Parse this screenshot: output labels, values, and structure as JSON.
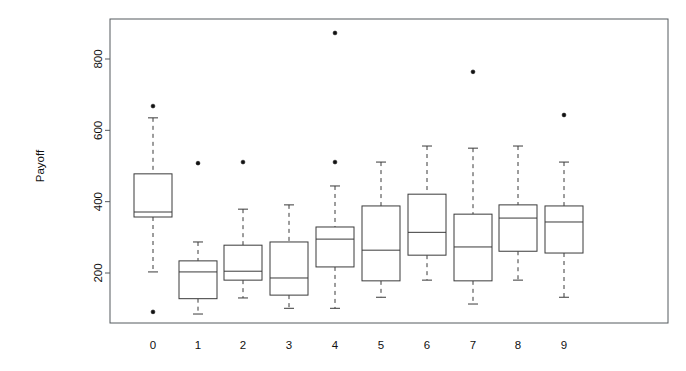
{
  "chart_data": {
    "type": "boxplot",
    "title": "",
    "subtitle": "",
    "xlabel": "",
    "ylabel": "Payoff",
    "categories": [
      "0",
      "1",
      "2",
      "3",
      "4",
      "5",
      "6",
      "7",
      "8",
      "9"
    ],
    "x_tick_labels": [
      "0",
      "1",
      "2",
      "3",
      "4",
      "5",
      "6",
      "7",
      "8",
      "9"
    ],
    "y_tick_labels": [
      "200",
      "400",
      "600",
      "800"
    ],
    "y_ticks": [
      200,
      400,
      600,
      800
    ],
    "ylim": [
      60,
      900
    ],
    "grid": false,
    "legend": null,
    "legend_position": "none",
    "frame": true,
    "colors": {
      "box_stroke": "#3a3a3a",
      "box_fill": "#ffffff",
      "whisker": "#3a3a3a",
      "outlier": "#111111",
      "frame": "#555a5e",
      "text": "#111111"
    },
    "boxes": [
      {
        "category": "0",
        "lower_whisker": 203,
        "q1": 357,
        "median": 371,
        "q3": 478,
        "upper_whisker": 635,
        "outliers": [
          668,
          91
        ]
      },
      {
        "category": "1",
        "lower_whisker": 85,
        "q1": 128,
        "median": 203,
        "q3": 234,
        "upper_whisker": 287,
        "outliers": [
          508
        ]
      },
      {
        "category": "2",
        "lower_whisker": 130,
        "q1": 180,
        "median": 205,
        "q3": 278,
        "upper_whisker": 379,
        "outliers": [
          511
        ]
      },
      {
        "category": "3",
        "lower_whisker": 101,
        "q1": 138,
        "median": 186,
        "q3": 287,
        "upper_whisker": 391,
        "outliers": []
      },
      {
        "category": "4",
        "lower_whisker": 101,
        "q1": 217,
        "median": 295,
        "q3": 329,
        "upper_whisker": 444,
        "outliers": [
          873,
          511
        ]
      },
      {
        "category": "5",
        "lower_whisker": 132,
        "q1": 178,
        "median": 264,
        "q3": 388,
        "upper_whisker": 511,
        "outliers": []
      },
      {
        "category": "6",
        "lower_whisker": 180,
        "q1": 250,
        "median": 314,
        "q3": 421,
        "upper_whisker": 556,
        "outliers": []
      },
      {
        "category": "7",
        "lower_whisker": 113,
        "q1": 178,
        "median": 273,
        "q3": 365,
        "upper_whisker": 550,
        "outliers": [
          764
        ]
      },
      {
        "category": "8",
        "lower_whisker": 180,
        "q1": 261,
        "median": 354,
        "q3": 391,
        "upper_whisker": 556,
        "outliers": []
      },
      {
        "category": "9",
        "lower_whisker": 132,
        "q1": 256,
        "median": 343,
        "q3": 388,
        "upper_whisker": 511,
        "outliers": [
          643
        ]
      }
    ]
  }
}
